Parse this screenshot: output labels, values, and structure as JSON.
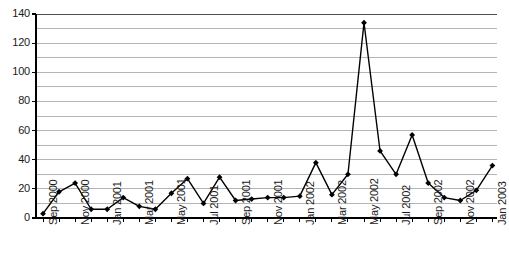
{
  "chart_data": {
    "type": "line",
    "title": "",
    "subtitle": "",
    "xlabel": "",
    "ylabel": "",
    "ylim": [
      0,
      140
    ],
    "ytick_step": 20,
    "gridline_step": 10,
    "grid": true,
    "legend": false,
    "marker": "diamond",
    "line_color": "#000000",
    "grid_color": "#b4b4b4",
    "axis_color": "#000000",
    "x": [
      "Sep 2000",
      "Oct 2000",
      "Nov 2000",
      "Dec 2000",
      "Jan 2001",
      "Feb 2001",
      "Mar 2001",
      "Apr 2001",
      "May 2001",
      "Jun 2001",
      "Jul 2001",
      "Aug 2001",
      "Sep 2001",
      "Oct 2001",
      "Nov 2001",
      "Dec 2001",
      "Jan 2002",
      "Feb 2002",
      "Mar 2002",
      "Apr 2002",
      "May 2002",
      "Jun 2002",
      "Jul 2002",
      "Aug 2002",
      "Sep 2002",
      "Oct 2002",
      "Nov 2002",
      "Dec 2002",
      "Jan 2003"
    ],
    "values": [
      3,
      18,
      24,
      6,
      6,
      14,
      8,
      6,
      17,
      27,
      10,
      28,
      12,
      13,
      14,
      14,
      15,
      38,
      16,
      30,
      134,
      46,
      30,
      57,
      24,
      14,
      12,
      19,
      36
    ],
    "xtick_labels": [
      "Sep 2000",
      "Nov 2000",
      "Jan 2001",
      "Mar 2001",
      "May 2001",
      "Jul 2001",
      "Sep 2001",
      "Nov 2001",
      "Jan 2002",
      "Mar 2002",
      "May 2002",
      "Jul 2002",
      "Sep 2002",
      "Nov 2002",
      "Jan 2003"
    ],
    "ytick_labels": [
      "0",
      "20",
      "40",
      "60",
      "80",
      "100",
      "120",
      "140"
    ],
    "ytick_values": [
      0,
      20,
      40,
      60,
      80,
      100,
      120,
      140
    ]
  }
}
